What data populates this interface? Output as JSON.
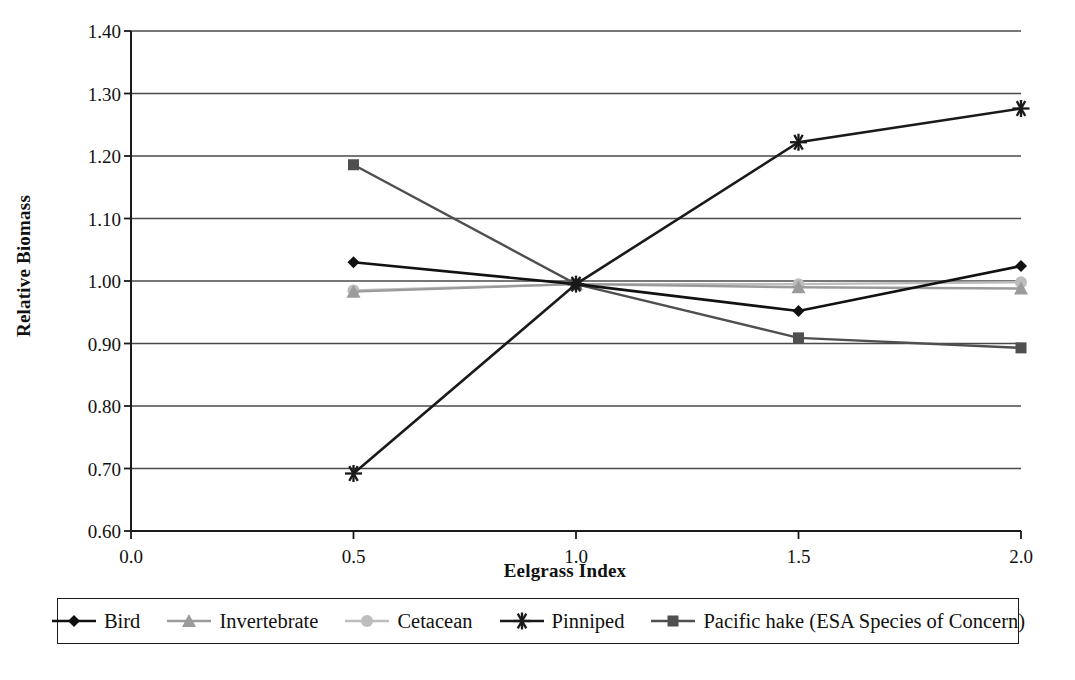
{
  "chart_data": {
    "type": "line",
    "title": "",
    "subtitle": "",
    "xlabel": "Eelgrass Index",
    "ylabel": "Relative Biomass",
    "x": [
      0.5,
      1.0,
      1.5,
      2.0
    ],
    "xlim": [
      0.0,
      2.0
    ],
    "ylim": [
      0.6,
      1.4
    ],
    "xticks": [
      "0.0",
      "0.5",
      "1.0",
      "1.5",
      "2.0"
    ],
    "xtick_values": [
      0.0,
      0.5,
      1.0,
      1.5,
      2.0
    ],
    "yticks": [
      "0.60",
      "0.70",
      "0.80",
      "0.90",
      "1.00",
      "1.10",
      "1.20",
      "1.30",
      "1.40"
    ],
    "ytick_values": [
      0.6,
      0.7,
      0.8,
      0.9,
      1.0,
      1.1,
      1.2,
      1.3,
      1.4
    ],
    "grid": "horizontal",
    "legend_position": "bottom",
    "series": [
      {
        "name": "Bird",
        "marker": "diamond",
        "color": "#111111",
        "line_width": 2.6,
        "values": [
          1.03,
          0.995,
          0.952,
          1.024
        ]
      },
      {
        "name": "Invertebrate",
        "marker": "triangle",
        "color": "#9b9b9b",
        "line_width": 2.4,
        "values": [
          0.983,
          0.995,
          0.99,
          0.988
        ]
      },
      {
        "name": "Cetacean",
        "marker": "circle",
        "color": "#bdbdbd",
        "line_width": 2.4,
        "values": [
          0.985,
          0.995,
          0.995,
          0.998
        ]
      },
      {
        "name": "Pinniped",
        "marker": "asterisk",
        "color": "#1a1a1a",
        "line_width": 2.6,
        "values": [
          0.692,
          0.995,
          1.222,
          1.276
        ]
      },
      {
        "name": "Pacific hake (ESA Species of Concern)",
        "marker": "square",
        "color": "#4f4f4f",
        "line_width": 2.4,
        "values": [
          1.186,
          0.995,
          0.909,
          0.893
        ]
      }
    ]
  },
  "legend": {
    "items": [
      {
        "label": "Bird",
        "marker": "diamond",
        "color": "#111111"
      },
      {
        "label": "Invertebrate",
        "marker": "triangle",
        "color": "#9b9b9b"
      },
      {
        "label": "Cetacean",
        "marker": "circle",
        "color": "#bdbdbd"
      },
      {
        "label": "Pinniped",
        "marker": "asterisk",
        "color": "#1a1a1a"
      },
      {
        "label": "Pacific hake (ESA Species of Concern)",
        "marker": "square",
        "color": "#4f4f4f"
      }
    ]
  },
  "axes": {
    "frame_color": "#1a1a1a",
    "grid_color": "#4a4a4a"
  }
}
